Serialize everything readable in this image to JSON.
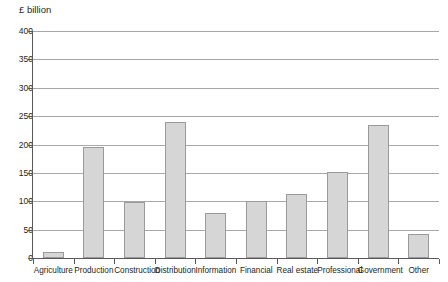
{
  "chart_data": {
    "type": "bar",
    "title": "",
    "subtitle": "",
    "unit_label": "£ billion",
    "xlabel": "",
    "ylabel": "£ billion",
    "ylim": [
      0,
      400
    ],
    "ytick_step": 50,
    "grid": true,
    "legend": false,
    "categories": [
      "Agriculture",
      "Production",
      "Construction",
      "Distribution",
      "Information",
      "Financial",
      "Real estate",
      "Professional",
      "Government",
      "Other"
    ],
    "values": [
      10,
      196,
      98,
      240,
      79,
      100,
      112,
      152,
      234,
      42
    ],
    "ytick_labels": [
      "400",
      "350",
      "300",
      "250",
      "200",
      "150",
      "100",
      "50",
      "0"
    ],
    "ytick_values": [
      400,
      350,
      300,
      250,
      200,
      150,
      100,
      50,
      0
    ],
    "colors": {
      "bar_fill": "#d6d6d6",
      "bar_border": "#9a9a9a",
      "gridline": "#a8a8a8",
      "axis": "#58595b",
      "text": "#231f20",
      "background": "#ffffff"
    }
  }
}
